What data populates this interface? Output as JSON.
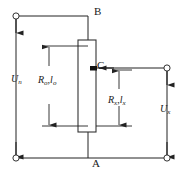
{
  "diagram": {
    "type": "electrical-schematic",
    "canvas": {
      "width": 183,
      "height": 174
    },
    "stroke_color": "#222222",
    "background_color": "#ffffff",
    "nodes": [
      {
        "id": "B",
        "label": "B",
        "x": 88,
        "y": 16,
        "role": "top-junction"
      },
      {
        "id": "C",
        "label": "C",
        "x": 88,
        "y": 68,
        "role": "slider-tap"
      },
      {
        "id": "A",
        "label": "A",
        "x": 88,
        "y": 158,
        "role": "bottom-junction"
      }
    ],
    "terminals": [
      {
        "id": "terminal-top-left",
        "x": 16,
        "y": 16,
        "shape": "open-circle"
      },
      {
        "id": "terminal-bottom-left",
        "x": 16,
        "y": 158,
        "shape": "open-circle"
      },
      {
        "id": "terminal-top-right",
        "x": 167,
        "y": 68,
        "shape": "open-circle"
      },
      {
        "id": "terminal-bottom-right",
        "x": 167,
        "y": 158,
        "shape": "open-circle"
      }
    ],
    "resistor": {
      "id": "slide-wire",
      "x": 78,
      "y": 40,
      "width": 18,
      "height": 92
    },
    "labels": {
      "node_b": "B",
      "node_c": "C",
      "node_a": "A",
      "voltage_left": "U",
      "voltage_left_sub": "n",
      "voltage_right": "U",
      "voltage_right_sub": "x",
      "resistance_full": "R",
      "resistance_full_sub": "o",
      "length_full": "l",
      "length_full_sub": "o",
      "resistance_full_sep": ",",
      "resistance_part": "R",
      "resistance_part_sub": "x",
      "length_part": "l",
      "length_part_sub": "x",
      "resistance_part_sep": ","
    },
    "dimensions": [
      {
        "id": "dimension-Ro-lo",
        "label_main": "R",
        "label_main_sub": "o",
        "label_sep": ",",
        "label_second": "l",
        "label_second_sub": "o",
        "span_from_y": 46,
        "span_to_y": 126,
        "x": 49
      },
      {
        "id": "dimension-Rx-lx",
        "label_main": "R",
        "label_main_sub": "x",
        "label_sep": ",",
        "label_second": "l",
        "label_second_sub": "x",
        "span_from_y": 70,
        "span_to_y": 126,
        "x": 119
      }
    ],
    "current_arrows": [
      {
        "id": "arrow-left-top",
        "x": 16,
        "y_from": 16,
        "y_to": 32,
        "direction": "down"
      },
      {
        "id": "arrow-left-bottom",
        "x": 16,
        "y_from": 142,
        "y_to": 158,
        "direction": "down"
      },
      {
        "id": "arrow-right-top",
        "x": 167,
        "y_from": 68,
        "y_to": 84,
        "direction": "down"
      },
      {
        "id": "arrow-right-bottom",
        "x": 167,
        "y_from": 142,
        "y_to": 158,
        "direction": "down"
      },
      {
        "id": "arrow-slider-tap",
        "x_from": 112,
        "x_to": 97,
        "y": 68,
        "direction": "left"
      }
    ]
  }
}
